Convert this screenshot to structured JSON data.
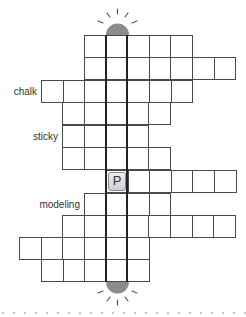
{
  "puzzle": {
    "clues": [
      {
        "label": "chalk",
        "row": 3
      },
      {
        "label": "sticky",
        "row": 5
      },
      {
        "label": "modeling",
        "row": 8
      }
    ],
    "rows": [
      {
        "row": 1,
        "start_x": 84,
        "end_x": 192,
        "top": 35
      },
      {
        "row": 2,
        "start_x": 84,
        "end_x": 235,
        "top": 57
      },
      {
        "row": 3,
        "start_x": 41,
        "end_x": 192,
        "top": 80
      },
      {
        "row": 4,
        "start_x": 62,
        "end_x": 170,
        "top": 102
      },
      {
        "row": 5,
        "start_x": 62,
        "end_x": 149,
        "top": 125
      },
      {
        "row": 6,
        "start_x": 62,
        "end_x": 170,
        "top": 147
      },
      {
        "row": 7,
        "start_x": 106,
        "end_x": 235,
        "top": 170
      },
      {
        "row": 8,
        "start_x": 84,
        "end_x": 170,
        "top": 193
      },
      {
        "row": 9,
        "start_x": 62,
        "end_x": 235,
        "top": 215
      },
      {
        "row": 10,
        "start_x": 19,
        "end_x": 149,
        "top": 237
      },
      {
        "row": 11,
        "start_x": 41,
        "end_x": 149,
        "top": 259
      }
    ],
    "placed_tile": {
      "letter": "P",
      "row": 7,
      "col_x": 106
    },
    "key_column_x": 106,
    "colors": {
      "dome": "#8c8c8c",
      "grid": "#4a4a4a",
      "dots": "#c8c8c8"
    }
  }
}
